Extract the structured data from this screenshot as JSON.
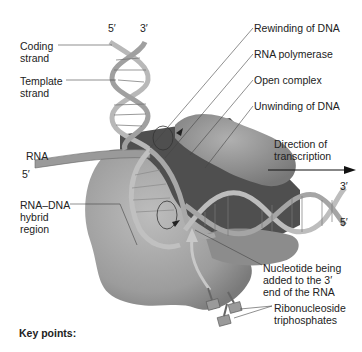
{
  "diagram": {
    "labels": {
      "coding_strand": "Coding\nstrand",
      "template_strand": "Template\nstrand",
      "rna": "RNA",
      "rna_dna_hybrid": "RNA–DNA\nhybrid\nregion",
      "rewinding": "Rewinding of DNA",
      "rna_polymerase": "RNA polymerase",
      "open_complex": "Open complex",
      "unwinding": "Unwinding of DNA",
      "direction": "Direction of\ntranscription",
      "nucleotide_added": "Nucleotide being\nadded to the 3′\nend of the RNA",
      "ribonucleoside": "Ribonucleoside\ntriphosphates",
      "key_points": "Key points:"
    },
    "ends": {
      "top_left": "5′",
      "top_right": "3′",
      "rna_end": "5′",
      "right_top": "3′",
      "right_bottom": "5′"
    },
    "colors": {
      "polymerase_light": "#a9a9a9",
      "polymerase_dark": "#5a5a5a",
      "dna_ribbon": "#b8b8b8",
      "dna_edge": "#6e6e6e",
      "leader_line": "#444444"
    }
  }
}
